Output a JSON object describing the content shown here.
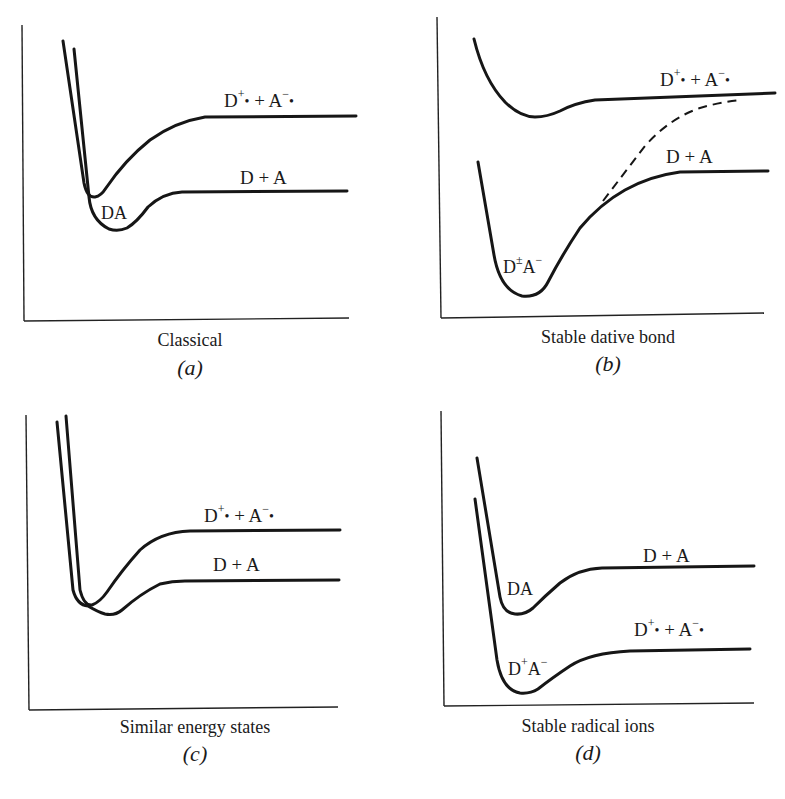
{
  "figure": {
    "panels": [
      {
        "id": "a",
        "caption": "Classical",
        "sublabel": "(a)",
        "labels": {
          "upper_state": {
            "base_d": "D",
            "sign_d": "+",
            "mid": " + A",
            "sign_a": "−"
          },
          "lower_state": "D + A",
          "complex": "DA"
        }
      },
      {
        "id": "b",
        "caption": "Stable dative bond",
        "sublabel": "(b)",
        "labels": {
          "upper_state": {
            "base_d": "D",
            "sign_d": "+",
            "mid": " + A",
            "sign_a": "−"
          },
          "lower_state": "D + A",
          "complex": {
            "d": "D",
            "d_sign": "±",
            "a": "A",
            "a_sign": "−"
          }
        }
      },
      {
        "id": "c",
        "caption": "Similar energy states",
        "sublabel": "(c)",
        "labels": {
          "upper_state": {
            "base_d": "D",
            "sign_d": "+",
            "mid": " + A",
            "sign_a": "−"
          },
          "lower_state": "D + A"
        }
      },
      {
        "id": "d",
        "caption": "Stable radical ions",
        "sublabel": "(d)",
        "labels": {
          "upper_state": "D + A",
          "complex_upper": "DA",
          "lower_state": {
            "base_d": "D",
            "sign_d": "+",
            "mid": " + A",
            "sign_a": "−"
          },
          "complex_lower": {
            "d": "D",
            "d_sign": "+",
            "a": "A",
            "a_sign": "−"
          }
        }
      }
    ],
    "radical_dot": "•",
    "line_color": "#161616",
    "background": "#ffffff"
  }
}
